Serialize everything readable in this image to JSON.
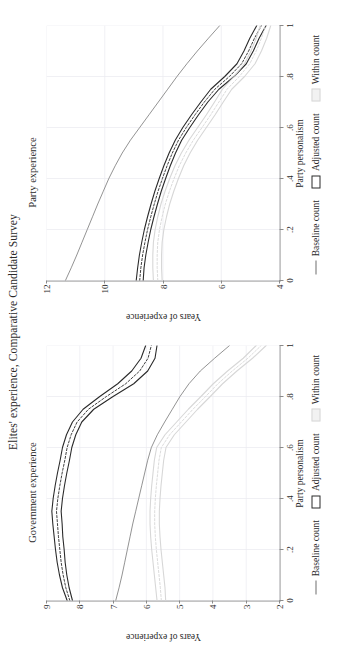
{
  "figure": {
    "title": "Elites' experience, Comparative Candidate Survey"
  },
  "legend": {
    "items": [
      {
        "label": "Baseline count",
        "marker": "line-key-icon",
        "color": "#6f6f6f"
      },
      {
        "label": "Adjusted count",
        "marker": "box-key-icon",
        "color": "#2b2b2b"
      },
      {
        "label": "Within count",
        "marker": "light-box-key-icon",
        "color": "#d7d7d7"
      }
    ]
  },
  "chart_data": [
    {
      "type": "line",
      "panel": "left",
      "title": "Government experience",
      "xlabel": "Party personalism",
      "ylabel": "Years of experience",
      "xlim": [
        0,
        1
      ],
      "ylim": [
        2,
        9
      ],
      "xticks": [
        0,
        0.2,
        0.4,
        0.6,
        0.8,
        1
      ],
      "xticklabels": [
        "0",
        ".2",
        ".4",
        ".6",
        ".8",
        "1"
      ],
      "yticks": [
        2,
        3,
        4,
        5,
        6,
        7,
        8,
        9
      ],
      "yticklabels": [
        "2",
        "3",
        "4",
        "5",
        "6",
        "7",
        "8",
        "9"
      ],
      "grid": true,
      "legend_position": "bottom",
      "x": [
        0,
        0.05,
        0.1,
        0.15,
        0.2,
        0.25,
        0.3,
        0.35,
        0.4,
        0.45,
        0.5,
        0.55,
        0.6,
        0.65,
        0.7,
        0.75,
        0.8,
        0.85,
        0.9,
        0.95,
        1
      ],
      "series": [
        {
          "name": "Adjusted count",
          "kind": "estimate",
          "color": "#2b2b2b",
          "style": "dashed",
          "values": [
            8.3,
            8.42,
            8.5,
            8.56,
            8.6,
            8.64,
            8.67,
            8.7,
            8.66,
            8.6,
            8.53,
            8.45,
            8.38,
            8.26,
            8.08,
            7.74,
            7.2,
            6.62,
            6.2,
            5.95,
            5.85
          ]
        },
        {
          "name": "Adjusted count CI upper",
          "kind": "ci-upper",
          "color": "#2b2b2b",
          "style": "solid",
          "values": [
            8.38,
            8.52,
            8.61,
            8.68,
            8.73,
            8.77,
            8.81,
            8.84,
            8.8,
            8.74,
            8.67,
            8.59,
            8.52,
            8.4,
            8.22,
            7.9,
            7.4,
            6.86,
            6.44,
            6.16,
            6.02
          ]
        },
        {
          "name": "Adjusted count CI lower",
          "kind": "ci-lower",
          "color": "#2b2b2b",
          "style": "solid",
          "values": [
            8.22,
            8.32,
            8.39,
            8.44,
            8.47,
            8.51,
            8.53,
            8.56,
            8.52,
            8.46,
            8.39,
            8.31,
            8.24,
            8.12,
            7.94,
            7.58,
            7.0,
            6.38,
            5.96,
            5.74,
            5.68
          ]
        },
        {
          "name": "Baseline count",
          "kind": "line",
          "color": "#6f6f6f",
          "style": "solid",
          "values": [
            6.92,
            6.82,
            6.73,
            6.65,
            6.57,
            6.49,
            6.41,
            6.32,
            6.23,
            6.14,
            6.05,
            5.96,
            5.85,
            5.67,
            5.45,
            5.22,
            4.99,
            4.72,
            4.38,
            3.95,
            3.5
          ]
        },
        {
          "name": "Within count",
          "kind": "estimate",
          "color": "#d7d7d7",
          "style": "dashed",
          "values": [
            5.55,
            5.58,
            5.62,
            5.66,
            5.7,
            5.73,
            5.75,
            5.75,
            5.73,
            5.7,
            5.66,
            5.62,
            5.55,
            5.3,
            4.95,
            4.6,
            4.22,
            3.85,
            3.42,
            2.95,
            2.55
          ]
        },
        {
          "name": "Within count CI upper",
          "kind": "ci-upper",
          "color": "#d7d7d7",
          "style": "solid",
          "values": [
            5.68,
            5.72,
            5.76,
            5.8,
            5.84,
            5.87,
            5.89,
            5.89,
            5.87,
            5.84,
            5.8,
            5.76,
            5.69,
            5.44,
            5.09,
            4.74,
            4.36,
            3.99,
            3.56,
            3.09,
            2.7
          ]
        },
        {
          "name": "Within count CI lower",
          "kind": "ci-lower",
          "color": "#d7d7d7",
          "style": "solid",
          "values": [
            5.42,
            5.44,
            5.48,
            5.52,
            5.56,
            5.59,
            5.61,
            5.61,
            5.59,
            5.56,
            5.52,
            5.48,
            5.41,
            5.16,
            4.81,
            4.46,
            4.08,
            3.71,
            3.28,
            2.81,
            2.4
          ]
        }
      ]
    },
    {
      "type": "line",
      "panel": "right",
      "title": "Party experience",
      "xlabel": "Party personalism",
      "ylabel": "Years of experience",
      "xlim": [
        0,
        1
      ],
      "ylim": [
        4,
        12
      ],
      "xticks": [
        0,
        0.2,
        0.4,
        0.6,
        0.8,
        1
      ],
      "xticklabels": [
        "0",
        ".2",
        ".4",
        ".6",
        ".8",
        "1"
      ],
      "yticks": [
        4,
        6,
        8,
        10,
        12
      ],
      "yticklabels": [
        "4",
        "6",
        "8",
        "10",
        "12"
      ],
      "grid": true,
      "legend_position": "bottom",
      "x": [
        0,
        0.05,
        0.1,
        0.15,
        0.2,
        0.25,
        0.3,
        0.35,
        0.4,
        0.45,
        0.5,
        0.55,
        0.6,
        0.65,
        0.7,
        0.75,
        0.8,
        0.85,
        0.9,
        0.95,
        1
      ],
      "series": [
        {
          "name": "Adjusted count",
          "kind": "estimate",
          "color": "#2b2b2b",
          "style": "dashed",
          "values": [
            8.8,
            8.76,
            8.7,
            8.62,
            8.53,
            8.42,
            8.3,
            8.17,
            8.02,
            7.86,
            7.68,
            7.47,
            7.2,
            6.9,
            6.58,
            6.22,
            5.72,
            5.3,
            5.06,
            4.86,
            4.62
          ]
        },
        {
          "name": "Adjusted count CI upper",
          "kind": "ci-upper",
          "color": "#2b2b2b",
          "style": "solid",
          "values": [
            8.92,
            8.87,
            8.81,
            8.73,
            8.64,
            8.53,
            8.41,
            8.28,
            8.13,
            7.97,
            7.79,
            7.58,
            7.32,
            7.02,
            6.7,
            6.36,
            5.88,
            5.46,
            5.22,
            5.02,
            4.78
          ]
        },
        {
          "name": "Adjusted count CI lower",
          "kind": "ci-lower",
          "color": "#2b2b2b",
          "style": "solid",
          "values": [
            8.68,
            8.65,
            8.59,
            8.51,
            8.42,
            8.31,
            8.19,
            8.06,
            7.91,
            7.75,
            7.57,
            7.36,
            7.08,
            6.78,
            6.46,
            6.08,
            5.56,
            5.14,
            4.9,
            4.7,
            4.46
          ]
        },
        {
          "name": "Baseline count",
          "kind": "line",
          "color": "#6f6f6f",
          "style": "solid",
          "values": [
            11.35,
            11.15,
            10.96,
            10.78,
            10.6,
            10.42,
            10.24,
            10.05,
            9.86,
            9.64,
            9.4,
            9.12,
            8.8,
            8.48,
            8.16,
            7.84,
            7.52,
            7.18,
            6.82,
            6.44,
            6.05
          ]
        },
        {
          "name": "Within count",
          "kind": "estimate",
          "color": "#d7d7d7",
          "style": "dashed",
          "values": [
            8.18,
            8.2,
            8.2,
            8.18,
            8.12,
            8.03,
            7.92,
            7.78,
            7.62,
            7.44,
            7.22,
            6.96,
            6.66,
            6.36,
            6.08,
            5.8,
            5.38,
            5.02,
            4.8,
            4.62,
            4.48
          ]
        },
        {
          "name": "Within count CI upper",
          "kind": "ci-upper",
          "color": "#d7d7d7",
          "style": "solid",
          "values": [
            8.33,
            8.35,
            8.35,
            8.33,
            8.27,
            8.18,
            8.07,
            7.93,
            7.77,
            7.59,
            7.37,
            7.11,
            6.81,
            6.51,
            6.23,
            5.96,
            5.56,
            5.2,
            4.98,
            4.8,
            4.66
          ]
        },
        {
          "name": "Within count CI lower",
          "kind": "ci-lower",
          "color": "#d7d7d7",
          "style": "solid",
          "values": [
            8.03,
            8.05,
            8.05,
            8.03,
            7.97,
            7.88,
            7.77,
            7.63,
            7.47,
            7.29,
            7.07,
            6.81,
            6.51,
            6.21,
            5.93,
            5.64,
            5.2,
            4.84,
            4.62,
            4.44,
            4.3
          ]
        }
      ]
    }
  ]
}
